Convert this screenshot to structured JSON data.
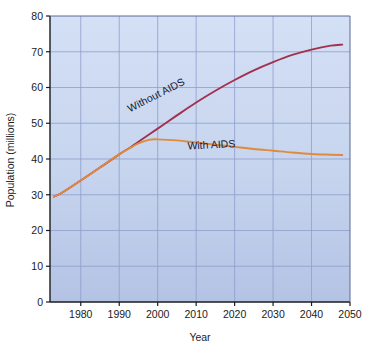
{
  "chart_data": {
    "type": "line",
    "title": "",
    "xlabel": "Year",
    "ylabel": "Population (millions)",
    "xlim": [
      1972,
      2050
    ],
    "ylim": [
      0,
      80
    ],
    "grid": true,
    "legend_position": "inline-annotations",
    "xticks": [
      "1980",
      "1990",
      "2000",
      "2010",
      "2020",
      "2030",
      "2040",
      "2050"
    ],
    "xtick_values": [
      1980,
      1990,
      2000,
      2010,
      2020,
      2030,
      2040,
      2050
    ],
    "yticks": [
      "0",
      "10",
      "20",
      "30",
      "40",
      "50",
      "60",
      "70",
      "80"
    ],
    "ytick_values": [
      0,
      10,
      20,
      30,
      40,
      50,
      60,
      70,
      80
    ],
    "series": [
      {
        "name": "Without AIDS",
        "color": "#a1314f",
        "x": [
          1973,
          1975,
          1980,
          1985,
          1990,
          1993,
          1995,
          2000,
          2005,
          2010,
          2015,
          2020,
          2025,
          2030,
          2035,
          2040,
          2045,
          2048
        ],
        "values": [
          29.5,
          30.5,
          34.0,
          37.6,
          41.3,
          43.3,
          44.8,
          48.5,
          52.2,
          55.8,
          59.1,
          62.1,
          64.8,
          67.1,
          69.1,
          70.6,
          71.7,
          72.0
        ]
      },
      {
        "name": "With AIDS",
        "color": "#e08a3c",
        "x": [
          1973,
          1975,
          1980,
          1985,
          1990,
          1993,
          1995,
          1998,
          2000,
          2005,
          2010,
          2015,
          2020,
          2025,
          2030,
          2035,
          2040,
          2045,
          2048
        ],
        "values": [
          29.5,
          30.5,
          34.0,
          37.6,
          41.3,
          43.2,
          44.4,
          45.4,
          45.5,
          45.2,
          44.6,
          44.0,
          43.4,
          42.8,
          42.3,
          41.8,
          41.4,
          41.2,
          41.1
        ]
      }
    ],
    "annotations": [
      {
        "text": "Without AIDS",
        "x": 2000,
        "y": 57.0,
        "rotation": -27
      },
      {
        "text": "With AIDS",
        "x": 2014,
        "y": 43.0,
        "rotation": -3
      }
    ],
    "colors": {
      "plot_bg_top": "#cfdcf3",
      "plot_bg_bottom": "#b7c6e6",
      "grid": "#8d9ccb",
      "axis": "#1b1b1b",
      "page_bg": "#ffffff"
    }
  }
}
